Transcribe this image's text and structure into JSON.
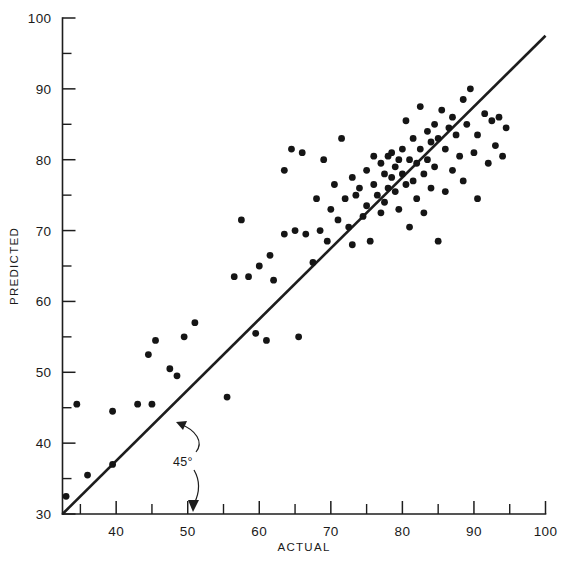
{
  "chart_data": {
    "type": "scatter",
    "title": "",
    "xlabel": "ACTUAL",
    "ylabel": "PREDICTED",
    "xlim": [
      32.5,
      100
    ],
    "ylim": [
      30,
      100
    ],
    "xticks": [
      40,
      50,
      60,
      70,
      80,
      90,
      100
    ],
    "yticks": [
      30,
      40,
      50,
      60,
      70,
      80,
      90,
      100
    ],
    "xtick_labels": [
      "40",
      "50",
      "60",
      "70",
      "80",
      "90",
      "100"
    ],
    "ytick_labels": [
      "30",
      "40",
      "50",
      "60",
      "70",
      "80",
      "90",
      "100"
    ],
    "minor_tick_step": 5,
    "grid": false,
    "legend": "none",
    "annotations": [
      {
        "text": "45°",
        "x": 50.5,
        "y": 39.0,
        "note": "label with two curved arrows: one to the 45-degree reference line, one to the x-axis"
      }
    ],
    "reference_line": {
      "label": "45°",
      "type": "identity",
      "from": [
        32.5,
        30.0
      ],
      "to": [
        100.0,
        97.5
      ]
    },
    "series": [
      {
        "name": "observations",
        "marker": "filled-circle",
        "color": "#151515",
        "points": [
          [
            33.0,
            32.5
          ],
          [
            34.5,
            45.5
          ],
          [
            36.0,
            35.5
          ],
          [
            39.5,
            44.5
          ],
          [
            39.5,
            37.0
          ],
          [
            43.0,
            45.5
          ],
          [
            44.5,
            52.5
          ],
          [
            45.0,
            45.5
          ],
          [
            45.5,
            54.5
          ],
          [
            47.5,
            50.5
          ],
          [
            48.5,
            49.5
          ],
          [
            49.5,
            55.0
          ],
          [
            51.0,
            57.0
          ],
          [
            55.5,
            46.5
          ],
          [
            56.5,
            63.5
          ],
          [
            57.5,
            71.5
          ],
          [
            58.5,
            63.5
          ],
          [
            59.5,
            55.5
          ],
          [
            60.0,
            65.0
          ],
          [
            61.0,
            54.5
          ],
          [
            61.5,
            66.5
          ],
          [
            62.0,
            63.0
          ],
          [
            63.5,
            69.5
          ],
          [
            63.5,
            78.5
          ],
          [
            64.5,
            81.5
          ],
          [
            65.0,
            70.0
          ],
          [
            65.5,
            55.0
          ],
          [
            66.0,
            81.0
          ],
          [
            66.5,
            69.5
          ],
          [
            67.5,
            65.5
          ],
          [
            68.0,
            74.5
          ],
          [
            68.5,
            70.0
          ],
          [
            69.0,
            80.0
          ],
          [
            69.5,
            68.5
          ],
          [
            70.0,
            73.0
          ],
          [
            70.5,
            76.5
          ],
          [
            71.0,
            71.5
          ],
          [
            71.5,
            83.0
          ],
          [
            72.0,
            74.5
          ],
          [
            72.5,
            70.5
          ],
          [
            73.0,
            77.5
          ],
          [
            73.0,
            68.0
          ],
          [
            73.5,
            75.0
          ],
          [
            74.0,
            76.0
          ],
          [
            74.5,
            72.0
          ],
          [
            75.0,
            78.5
          ],
          [
            75.0,
            73.5
          ],
          [
            75.5,
            68.5
          ],
          [
            76.0,
            80.5
          ],
          [
            76.0,
            76.5
          ],
          [
            76.5,
            75.0
          ],
          [
            77.0,
            79.5
          ],
          [
            77.0,
            72.5
          ],
          [
            77.5,
            78.0
          ],
          [
            77.5,
            74.0
          ],
          [
            78.0,
            80.5
          ],
          [
            78.0,
            76.0
          ],
          [
            78.5,
            81.0
          ],
          [
            78.5,
            77.5
          ],
          [
            79.0,
            79.0
          ],
          [
            79.0,
            75.5
          ],
          [
            79.5,
            80.0
          ],
          [
            79.5,
            73.0
          ],
          [
            80.0,
            81.5
          ],
          [
            80.0,
            78.0
          ],
          [
            80.5,
            85.5
          ],
          [
            80.5,
            76.5
          ],
          [
            81.0,
            80.0
          ],
          [
            81.0,
            70.5
          ],
          [
            81.5,
            83.0
          ],
          [
            81.5,
            77.0
          ],
          [
            82.0,
            79.5
          ],
          [
            82.0,
            74.5
          ],
          [
            82.5,
            81.5
          ],
          [
            82.5,
            87.5
          ],
          [
            83.0,
            78.0
          ],
          [
            83.0,
            72.5
          ],
          [
            83.5,
            84.0
          ],
          [
            83.5,
            80.0
          ],
          [
            84.0,
            82.5
          ],
          [
            84.0,
            76.0
          ],
          [
            84.5,
            85.0
          ],
          [
            84.5,
            79.0
          ],
          [
            85.0,
            83.0
          ],
          [
            85.0,
            68.5
          ],
          [
            85.5,
            87.0
          ],
          [
            86.0,
            81.5
          ],
          [
            86.0,
            75.5
          ],
          [
            86.5,
            84.5
          ],
          [
            87.0,
            86.0
          ],
          [
            87.0,
            78.5
          ],
          [
            87.5,
            83.5
          ],
          [
            88.0,
            80.5
          ],
          [
            88.5,
            88.5
          ],
          [
            88.5,
            77.0
          ],
          [
            89.0,
            85.0
          ],
          [
            89.5,
            90.0
          ],
          [
            90.0,
            81.0
          ],
          [
            90.5,
            83.5
          ],
          [
            90.5,
            74.5
          ],
          [
            91.5,
            86.5
          ],
          [
            92.0,
            79.5
          ],
          [
            92.5,
            85.5
          ],
          [
            93.0,
            82.0
          ],
          [
            93.5,
            86.0
          ],
          [
            94.0,
            80.5
          ],
          [
            94.5,
            84.5
          ]
        ]
      }
    ]
  },
  "axis": {
    "x_title": "ACTUAL",
    "y_title": "PREDICTED"
  },
  "annotation": {
    "angle_label": "45°"
  }
}
